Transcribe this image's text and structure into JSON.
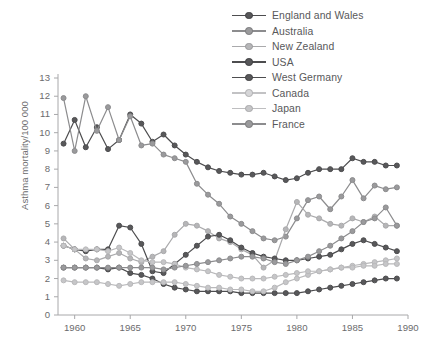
{
  "chart_data": {
    "type": "line",
    "title": "",
    "xlabel": "",
    "ylabel": "Asthma mortality/100 000",
    "xlim": [
      1958.5,
      1990
    ],
    "ylim": [
      0,
      13
    ],
    "xticks": [
      1960,
      1965,
      1970,
      1975,
      1980,
      1985,
      1990
    ],
    "yticks": [
      0,
      1,
      2,
      3,
      4,
      5,
      6,
      7,
      8,
      9,
      10,
      11,
      12,
      13
    ],
    "grid": false,
    "legend_position": "top-right",
    "x": [
      1959,
      1960,
      1961,
      1962,
      1963,
      1964,
      1965,
      1966,
      1967,
      1968,
      1969,
      1970,
      1971,
      1972,
      1973,
      1974,
      1975,
      1976,
      1977,
      1978,
      1979,
      1980,
      1981,
      1982,
      1983,
      1984,
      1985,
      1986,
      1987,
      1988,
      1989
    ],
    "series": [
      {
        "name": "England and Wales",
        "color": "#4d4d4f",
        "marker_fill": "#58585a",
        "values": [
          9.4,
          10.7,
          9.2,
          10.3,
          9.1,
          9.6,
          11.0,
          10.5,
          9.5,
          9.9,
          9.3,
          8.8,
          8.4,
          8.1,
          7.9,
          7.8,
          7.7,
          7.7,
          7.8,
          7.6,
          7.4,
          7.5,
          7.8,
          8.0,
          8.0,
          8.0,
          8.6,
          8.4,
          8.4,
          8.2,
          8.2
        ]
      },
      {
        "name": "Australia",
        "color": "#8c8c8e",
        "marker_fill": "#9a9a9c",
        "values": [
          11.9,
          9.0,
          12.0,
          10.1,
          11.4,
          9.6,
          10.9,
          9.3,
          9.4,
          8.8,
          8.6,
          8.4,
          7.2,
          6.6,
          6.1,
          5.4,
          5.0,
          4.6,
          4.2,
          4.1,
          4.3,
          5.3,
          6.3,
          6.5,
          5.8,
          6.5,
          7.4,
          6.4,
          7.1,
          6.9,
          7.0
        ]
      },
      {
        "name": "New Zealand",
        "color": "#aaaaac",
        "marker_fill": "#b6b6b8",
        "values": [
          4.2,
          3.6,
          3.1,
          3.0,
          3.2,
          3.4,
          3.1,
          2.9,
          3.2,
          3.5,
          4.4,
          5.0,
          4.9,
          4.6,
          4.2,
          4.0,
          3.6,
          3.3,
          2.6,
          3.0,
          4.7,
          6.2,
          5.5,
          5.3,
          5.0,
          4.9,
          5.3,
          5.1,
          5.4,
          4.9,
          4.9
        ]
      },
      {
        "name": "USA",
        "color": "#4d4d4f",
        "marker_fill": "#58585a",
        "values": [
          2.6,
          2.6,
          2.6,
          2.6,
          2.5,
          2.6,
          2.3,
          2.2,
          2.0,
          1.7,
          1.5,
          1.4,
          1.3,
          1.3,
          1.3,
          1.3,
          1.2,
          1.2,
          1.2,
          1.2,
          1.2,
          1.2,
          1.3,
          1.4,
          1.5,
          1.6,
          1.7,
          1.8,
          1.9,
          2.0,
          2.0
        ]
      },
      {
        "name": "West Germany",
        "color": "#4d4d4f",
        "marker_fill": "#58585a",
        "values": [
          3.8,
          3.6,
          3.5,
          3.6,
          3.6,
          4.9,
          4.8,
          3.9,
          2.4,
          2.3,
          2.8,
          3.3,
          3.8,
          4.3,
          4.4,
          4.1,
          3.7,
          3.4,
          3.2,
          3.1,
          3.0,
          3.0,
          3.1,
          3.2,
          3.3,
          3.6,
          3.9,
          4.1,
          3.9,
          3.7,
          3.5
        ]
      },
      {
        "name": "Canada",
        "color": "#b9b9bb",
        "marker_fill": "#c6c6c8",
        "values": [
          1.9,
          1.8,
          1.8,
          1.8,
          1.7,
          1.6,
          1.7,
          1.8,
          1.8,
          1.8,
          1.8,
          1.7,
          1.6,
          1.5,
          1.5,
          1.4,
          1.4,
          1.3,
          1.3,
          1.5,
          1.8,
          2.0,
          2.2,
          2.4,
          2.5,
          2.6,
          2.7,
          2.8,
          2.9,
          3.0,
          3.1
        ]
      },
      {
        "name": "Japan",
        "color": "#b9b9bb",
        "marker_fill": "#c6c6c8",
        "values": [
          3.8,
          3.6,
          3.6,
          3.6,
          3.5,
          3.7,
          3.4,
          3.0,
          2.9,
          2.9,
          2.8,
          2.6,
          2.5,
          2.4,
          2.2,
          2.1,
          2.0,
          2.0,
          2.0,
          2.1,
          2.2,
          2.3,
          2.4,
          2.4,
          2.5,
          2.6,
          2.6,
          2.7,
          2.7,
          2.8,
          2.8
        ]
      },
      {
        "name": "France",
        "color": "#8c8c8e",
        "marker_fill": "#9a9a9c",
        "values": [
          2.6,
          2.6,
          2.6,
          2.6,
          2.6,
          2.6,
          2.6,
          2.6,
          2.6,
          2.5,
          2.6,
          2.7,
          2.8,
          2.9,
          3.0,
          3.1,
          3.2,
          3.2,
          3.1,
          2.9,
          2.8,
          3.0,
          3.2,
          3.5,
          3.8,
          4.2,
          4.6,
          5.1,
          5.3,
          5.9,
          4.9
        ]
      }
    ]
  },
  "legend": {
    "items": [
      {
        "label": "England and Wales"
      },
      {
        "label": "Australia"
      },
      {
        "label": "New Zealand"
      },
      {
        "label": "USA"
      },
      {
        "label": "West Germany"
      },
      {
        "label": "Canada"
      },
      {
        "label": "Japan"
      },
      {
        "label": "France"
      }
    ]
  },
  "axes": {
    "y_title": "Asthma mortality/100 000",
    "axis_color": "#a8a8aa",
    "tick_color": "#6b6b6d"
  }
}
